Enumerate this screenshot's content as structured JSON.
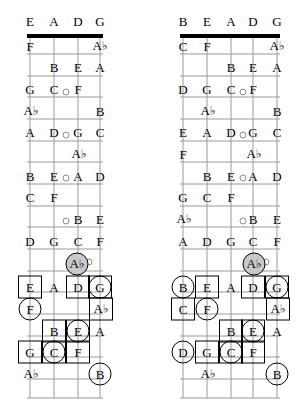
{
  "diagram": {
    "type": "fretboard-chart-pair",
    "colors": {
      "line": "#9a9a9a",
      "nut": "#000000",
      "marker": "#000000",
      "shaded_fill": "#c9c9c9",
      "text": "#000000",
      "background": "#ffffff"
    }
  },
  "boards": [
    {
      "id": "left",
      "name": "four-string-fretboard",
      "string_count": 4,
      "open_strings": [
        "E",
        "A",
        "D",
        "G"
      ],
      "string_x": [
        30,
        54,
        78,
        100
      ],
      "nut": {
        "x1": 27,
        "x2": 103,
        "y": 36
      },
      "fret_ys": [
        36,
        54,
        76,
        97,
        119,
        141,
        162,
        184,
        206,
        227,
        249,
        271,
        292,
        314,
        336,
        357,
        379,
        398
      ],
      "header_y": 21,
      "inlays": [
        {
          "x": 66,
          "y": 92
        },
        {
          "x": 66,
          "y": 135
        },
        {
          "x": 66,
          "y": 178
        },
        {
          "x": 66,
          "y": 221
        },
        {
          "x": 89,
          "y": 262
        }
      ],
      "notes": [
        {
          "label": "E",
          "x": 30,
          "y": 21,
          "header": true
        },
        {
          "label": "A",
          "x": 54,
          "y": 21,
          "header": true
        },
        {
          "label": "D",
          "x": 78,
          "y": 21,
          "header": true
        },
        {
          "label": "G",
          "x": 100,
          "y": 21,
          "header": true
        },
        {
          "label": "F",
          "x": 30,
          "y": 46
        },
        {
          "label": "Ab",
          "x": 100,
          "y": 46
        },
        {
          "label": "B",
          "x": 54,
          "y": 67
        },
        {
          "label": "E",
          "x": 78,
          "y": 67
        },
        {
          "label": "A",
          "x": 100,
          "y": 67
        },
        {
          "label": "G",
          "x": 30,
          "y": 89
        },
        {
          "label": "C",
          "x": 54,
          "y": 89
        },
        {
          "label": "F",
          "x": 78,
          "y": 89
        },
        {
          "label": "Ab",
          "x": 31,
          "y": 111
        },
        {
          "label": "B",
          "x": 100,
          "y": 111
        },
        {
          "label": "A",
          "x": 30,
          "y": 132
        },
        {
          "label": "D",
          "x": 54,
          "y": 132
        },
        {
          "label": "G",
          "x": 78,
          "y": 132
        },
        {
          "label": "C",
          "x": 100,
          "y": 132
        },
        {
          "label": "Ab",
          "x": 79,
          "y": 154
        },
        {
          "label": "B",
          "x": 30,
          "y": 176
        },
        {
          "label": "E",
          "x": 54,
          "y": 176
        },
        {
          "label": "A",
          "x": 78,
          "y": 176
        },
        {
          "label": "D",
          "x": 100,
          "y": 176
        },
        {
          "label": "C",
          "x": 30,
          "y": 197
        },
        {
          "label": "F",
          "x": 54,
          "y": 197
        },
        {
          "label": "B",
          "x": 78,
          "y": 219
        },
        {
          "label": "E",
          "x": 100,
          "y": 219
        },
        {
          "label": "D",
          "x": 30,
          "y": 241
        },
        {
          "label": "G",
          "x": 54,
          "y": 241
        },
        {
          "label": "C",
          "x": 78,
          "y": 241
        },
        {
          "label": "F",
          "x": 100,
          "y": 241
        },
        {
          "label": "Ab",
          "x": 77,
          "y": 264,
          "marker": "circle-shaded"
        },
        {
          "label": "E",
          "x": 30,
          "y": 287,
          "marker": "box"
        },
        {
          "label": "A",
          "x": 54,
          "y": 287
        },
        {
          "label": "D",
          "x": 78,
          "y": 287,
          "marker": "box"
        },
        {
          "label": "G",
          "x": 100,
          "y": 287,
          "marker": "box-circle"
        },
        {
          "label": "F",
          "x": 30,
          "y": 309,
          "marker": "circle"
        },
        {
          "label": "Ab",
          "x": 101,
          "y": 309,
          "marker": "box"
        },
        {
          "label": "B",
          "x": 54,
          "y": 331,
          "marker": "box"
        },
        {
          "label": "E",
          "x": 78,
          "y": 331,
          "marker": "box-circle"
        },
        {
          "label": "A",
          "x": 100,
          "y": 331
        },
        {
          "label": "G",
          "x": 30,
          "y": 352,
          "marker": "box"
        },
        {
          "label": "C",
          "x": 54,
          "y": 352,
          "marker": "box-circle"
        },
        {
          "label": "F",
          "x": 78,
          "y": 352,
          "marker": "box"
        },
        {
          "label": "Ab",
          "x": 31,
          "y": 374
        },
        {
          "label": "B",
          "x": 100,
          "y": 374,
          "marker": "circle"
        }
      ]
    },
    {
      "id": "right",
      "name": "five-string-fretboard",
      "string_count": 5,
      "open_strings": [
        "B",
        "E",
        "A",
        "D",
        "G"
      ],
      "string_x": [
        30,
        54,
        78,
        100,
        124
      ],
      "nut": {
        "x1": 27,
        "x2": 127,
        "y": 36
      },
      "fret_ys": [
        36,
        54,
        76,
        97,
        119,
        141,
        162,
        184,
        206,
        227,
        249,
        271,
        292,
        314,
        336,
        357,
        379,
        398
      ],
      "header_y": 21,
      "inlays": [
        {
          "x": 90,
          "y": 92
        },
        {
          "x": 90,
          "y": 135
        },
        {
          "x": 90,
          "y": 178
        },
        {
          "x": 90,
          "y": 221
        },
        {
          "x": 113,
          "y": 262
        }
      ],
      "notes": [
        {
          "label": "B",
          "x": 30,
          "y": 21,
          "header": true
        },
        {
          "label": "E",
          "x": 54,
          "y": 21,
          "header": true
        },
        {
          "label": "A",
          "x": 78,
          "y": 21,
          "header": true
        },
        {
          "label": "D",
          "x": 100,
          "y": 21,
          "header": true
        },
        {
          "label": "G",
          "x": 124,
          "y": 21,
          "header": true
        },
        {
          "label": "C",
          "x": 30,
          "y": 46
        },
        {
          "label": "F",
          "x": 54,
          "y": 46
        },
        {
          "label": "Ab",
          "x": 124,
          "y": 46
        },
        {
          "label": "B",
          "x": 78,
          "y": 67
        },
        {
          "label": "E",
          "x": 100,
          "y": 67
        },
        {
          "label": "A",
          "x": 124,
          "y": 67
        },
        {
          "label": "D",
          "x": 30,
          "y": 89
        },
        {
          "label": "G",
          "x": 54,
          "y": 89
        },
        {
          "label": "C",
          "x": 78,
          "y": 89
        },
        {
          "label": "F",
          "x": 100,
          "y": 89
        },
        {
          "label": "Ab",
          "x": 55,
          "y": 111
        },
        {
          "label": "B",
          "x": 124,
          "y": 111
        },
        {
          "label": "E",
          "x": 30,
          "y": 132
        },
        {
          "label": "A",
          "x": 54,
          "y": 132
        },
        {
          "label": "D",
          "x": 78,
          "y": 132
        },
        {
          "label": "G",
          "x": 100,
          "y": 132
        },
        {
          "label": "C",
          "x": 124,
          "y": 132
        },
        {
          "label": "F",
          "x": 30,
          "y": 154
        },
        {
          "label": "Ab",
          "x": 101,
          "y": 154
        },
        {
          "label": "B",
          "x": 54,
          "y": 176
        },
        {
          "label": "E",
          "x": 78,
          "y": 176
        },
        {
          "label": "A",
          "x": 100,
          "y": 176
        },
        {
          "label": "D",
          "x": 124,
          "y": 176
        },
        {
          "label": "G",
          "x": 30,
          "y": 197
        },
        {
          "label": "C",
          "x": 54,
          "y": 197
        },
        {
          "label": "F",
          "x": 78,
          "y": 197
        },
        {
          "label": "Ab",
          "x": 31,
          "y": 219
        },
        {
          "label": "B",
          "x": 100,
          "y": 219
        },
        {
          "label": "E",
          "x": 124,
          "y": 219
        },
        {
          "label": "A",
          "x": 30,
          "y": 241
        },
        {
          "label": "D",
          "x": 54,
          "y": 241
        },
        {
          "label": "G",
          "x": 78,
          "y": 241
        },
        {
          "label": "C",
          "x": 100,
          "y": 241
        },
        {
          "label": "F",
          "x": 124,
          "y": 241
        },
        {
          "label": "Ab",
          "x": 101,
          "y": 264,
          "marker": "circle-shaded"
        },
        {
          "label": "B",
          "x": 30,
          "y": 287,
          "marker": "circle"
        },
        {
          "label": "E",
          "x": 54,
          "y": 287,
          "marker": "box"
        },
        {
          "label": "A",
          "x": 78,
          "y": 287
        },
        {
          "label": "D",
          "x": 100,
          "y": 287,
          "marker": "box"
        },
        {
          "label": "G",
          "x": 124,
          "y": 287,
          "marker": "box-circle"
        },
        {
          "label": "C",
          "x": 30,
          "y": 309,
          "marker": "box"
        },
        {
          "label": "F",
          "x": 54,
          "y": 309,
          "marker": "circle"
        },
        {
          "label": "Ab",
          "x": 125,
          "y": 309,
          "marker": "box"
        },
        {
          "label": "B",
          "x": 78,
          "y": 331,
          "marker": "box"
        },
        {
          "label": "E",
          "x": 100,
          "y": 331,
          "marker": "box-circle"
        },
        {
          "label": "A",
          "x": 124,
          "y": 331
        },
        {
          "label": "D",
          "x": 30,
          "y": 352,
          "marker": "circle"
        },
        {
          "label": "G",
          "x": 54,
          "y": 352,
          "marker": "box"
        },
        {
          "label": "C",
          "x": 78,
          "y": 352,
          "marker": "box-circle"
        },
        {
          "label": "F",
          "x": 100,
          "y": 352,
          "marker": "box"
        },
        {
          "label": "Ab",
          "x": 55,
          "y": 374
        },
        {
          "label": "B",
          "x": 124,
          "y": 374,
          "marker": "circle"
        }
      ]
    }
  ]
}
